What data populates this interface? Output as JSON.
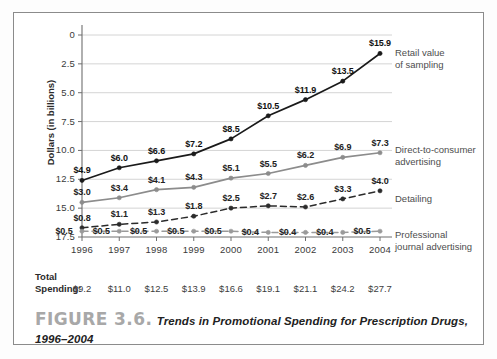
{
  "figure": {
    "number_label": "FIGURE 3.6.",
    "caption": "Trends in Promotional Spending for Prescription Drugs, 1996–2004"
  },
  "axes": {
    "y_title": "Dollars (in billions)",
    "y_ticks": [
      "17.5",
      "15.0",
      "12.5",
      "10.0",
      "7.5",
      "5.0",
      "2.5",
      "0"
    ],
    "x_ticks": [
      "1996",
      "1997",
      "1998",
      "1999",
      "2000",
      "2001",
      "2002",
      "2003",
      "2004"
    ]
  },
  "totals": {
    "label_line1": "Total",
    "label_line2": "Spending:",
    "values": [
      "$9.2",
      "$11.0",
      "$12.5",
      "$13.9",
      "$16.6",
      "$19.1",
      "$21.1",
      "$24.2",
      "$27.7"
    ]
  },
  "legend": {
    "retail": {
      "line1": "Retail value",
      "line2": "of sampling"
    },
    "dtc": {
      "line1": "Direct-to-consumer",
      "line2": "advertising"
    },
    "detailing": {
      "line1": "Detailing",
      "line2": ""
    },
    "journal": {
      "line1": "Professional",
      "line2": "journal advertising"
    }
  },
  "colors": {
    "retail_line": "#1a1a1a",
    "dtc_line": "#8c8c8c",
    "detailing_line": "#2b2b2b",
    "journal_line": "#9a9a9a",
    "grid": "#cfcfcf",
    "axis": "#6e6e6e",
    "frame": "#8b8b8b",
    "caption_number": "#a8a8a8"
  },
  "chart_data": {
    "type": "line",
    "title": "Trends in Promotional Spending for Prescription Drugs, 1996–2004",
    "xlabel": "",
    "ylabel": "Dollars (in billions)",
    "ylim": [
      0,
      17.5
    ],
    "ytick_values": [
      0,
      2.5,
      5.0,
      7.5,
      10.0,
      12.5,
      15.0,
      17.5
    ],
    "grid": true,
    "legend_position": "right-inline-series-labels",
    "categories": [
      "1996",
      "1997",
      "1998",
      "1999",
      "2000",
      "2001",
      "2002",
      "2003",
      "2004"
    ],
    "series": [
      {
        "name": "Retail value of sampling",
        "style": "solid",
        "color": "#1a1a1a",
        "values": [
          4.9,
          6.0,
          6.6,
          7.2,
          8.5,
          10.5,
          11.9,
          13.5,
          15.9
        ],
        "labels": [
          "$4.9",
          "$6.0",
          "$6.6",
          "$7.2",
          "$8.5",
          "$10.5",
          "$11.9",
          "$13.5",
          "$15.9"
        ]
      },
      {
        "name": "Direct-to-consumer advertising",
        "style": "solid",
        "color": "#8c8c8c",
        "values": [
          3.0,
          3.4,
          4.1,
          4.3,
          5.1,
          5.5,
          6.2,
          6.9,
          7.3
        ],
        "labels": [
          "$3.0",
          "$3.4",
          "$4.1",
          "$4.3",
          "$5.1",
          "$5.5",
          "$6.2",
          "$6.9",
          "$7.3"
        ]
      },
      {
        "name": "Detailing",
        "style": "dashed",
        "color": "#2b2b2b",
        "values": [
          0.8,
          1.1,
          1.3,
          1.8,
          2.5,
          2.7,
          2.6,
          3.3,
          4.0
        ],
        "labels": [
          "$0.8",
          "$1.1",
          "$1.3",
          "$1.8",
          "$2.5",
          "$2.7",
          "$2.6",
          "$3.3",
          "$4.0"
        ]
      },
      {
        "name": "Professional journal advertising",
        "style": "dashed",
        "color": "#9a9a9a",
        "values": [
          0.5,
          0.5,
          0.5,
          0.5,
          0.5,
          0.4,
          0.4,
          0.4,
          0.5
        ],
        "labels": [
          "$0.5",
          "$0.5",
          "$0.5",
          "$0.5",
          "$0.5",
          "$0.4",
          "$0.4",
          "$0.4",
          "$0.5"
        ]
      }
    ],
    "totals": {
      "name": "Total Spending",
      "values": [
        9.2,
        11.0,
        12.5,
        13.9,
        16.6,
        19.1,
        21.1,
        24.2,
        27.7
      ]
    }
  }
}
